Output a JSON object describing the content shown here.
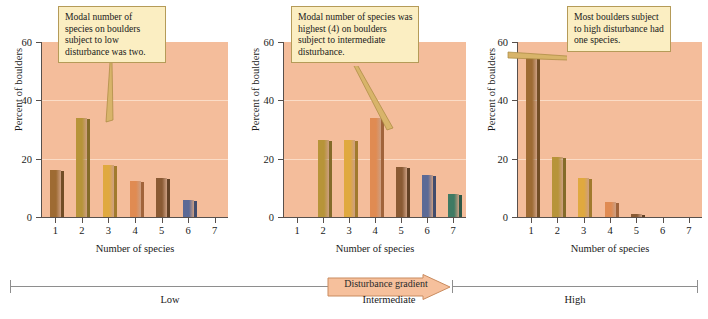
{
  "figure": {
    "axis_titles": {
      "y": "Percent of boulders",
      "x": "Number of species"
    },
    "yticks": [
      "0",
      "20",
      "40",
      "60"
    ],
    "xticks": [
      "1",
      "2",
      "3",
      "4",
      "5",
      "6",
      "7"
    ]
  },
  "gradient": {
    "arrow_label": "Disturbance gradient",
    "levels": [
      "Low",
      "Intermediate",
      "High"
    ]
  },
  "annotations": {
    "low": "Modal number of species on boulders subject to low disturbance was two.",
    "intermediate": "Modal number of species was highest (4) on boulders subject to intermediate disturbance.",
    "high": "Most boulders subject to high disturbance had one species."
  },
  "colors": {
    "plot_background": "#f4bd9b",
    "gridline": "#fbdcc6",
    "callout_fill": "#fbeec2",
    "callout_border": "#b59b58",
    "arrow_fill": "#f6c09c",
    "arrow_border": "#c98b5e",
    "axis": "#58504c",
    "series": [
      "#9e6b33",
      "#b79439",
      "#e0a93f",
      "#e08b52",
      "#8a5a33",
      "#5c6a96",
      "#3f7a63"
    ]
  },
  "chart_data": [
    {
      "type": "bar",
      "title": "Low disturbance",
      "categories": [
        "1",
        "2",
        "3",
        "4",
        "5",
        "6",
        "7"
      ],
      "values": [
        16,
        34,
        18,
        12.5,
        13.5,
        6,
        0
      ],
      "xlabel": "Number of species",
      "ylabel": "Percent of boulders",
      "ylim": [
        0,
        60
      ],
      "yticks": [
        0,
        20,
        40,
        60
      ],
      "grid": true,
      "legend": "none"
    },
    {
      "type": "bar",
      "title": "Intermediate disturbance",
      "categories": [
        "1",
        "2",
        "3",
        "4",
        "5",
        "6",
        "7"
      ],
      "values": [
        0,
        26.5,
        26.5,
        34,
        17,
        14.5,
        8
      ],
      "xlabel": "Number of species",
      "ylabel": "Percent of boulders",
      "ylim": [
        0,
        60
      ],
      "yticks": [
        0,
        20,
        40,
        60
      ],
      "grid": true,
      "legend": "none"
    },
    {
      "type": "bar",
      "title": "High disturbance",
      "categories": [
        "1",
        "2",
        "3",
        "4",
        "5",
        "6",
        "7"
      ],
      "values": [
        56,
        20.5,
        13.5,
        5,
        1,
        0,
        0
      ],
      "xlabel": "Number of species",
      "ylabel": "Percent of boulders",
      "ylim": [
        0,
        60
      ],
      "yticks": [
        0,
        20,
        40,
        60
      ],
      "grid": true,
      "legend": "none"
    }
  ]
}
